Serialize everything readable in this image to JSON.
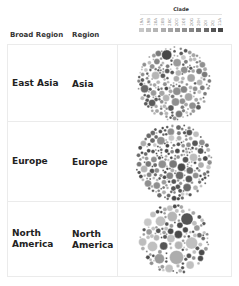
{
  "header": {
    "col_broad_region": "Broad Region",
    "col_region": "Region"
  },
  "legend": {
    "title": "Clade",
    "labels": [
      "19A",
      "19B",
      "20A",
      "20B",
      "20C",
      "20D",
      "20E",
      "20G",
      "20H",
      "20I",
      "20J",
      "21A"
    ],
    "colors": [
      "#c8c8c8",
      "#bdbdbd",
      "#b5b5b5",
      "#adadad",
      "#a5a5a5",
      "#9a9a9a",
      "#8f8f8f",
      "#858585",
      "#787878",
      "#6a6a6a",
      "#555555",
      "#484848"
    ]
  },
  "rows": [
    {
      "broad_region": "East Asia",
      "region": "Asia",
      "height": 77,
      "dominant": [
        "#7a7a7a",
        "#8f8f8f",
        "#a5a5a5",
        "#5a5a5a",
        "#b5b5b5"
      ]
    },
    {
      "broad_region": "Europe",
      "region": "Europe",
      "height": 80,
      "dominant": [
        "#4a4a4a",
        "#555555",
        "#6a6a6a",
        "#8f8f8f",
        "#adadad"
      ]
    },
    {
      "broad_region": "North America",
      "region": "North America",
      "height": 74,
      "dominant": [
        "#c0c0c0",
        "#4a4a4a",
        "#b5b5b5",
        "#555555",
        "#9a9a9a"
      ]
    }
  ],
  "chart_data": {
    "type": "packed-bubble",
    "title": "",
    "legend_title": "Clade",
    "legend_position": "top-right",
    "rows_dimension": [
      "Broad Region",
      "Region"
    ],
    "color_dimension": "Clade",
    "categories": [
      "East Asia / Asia",
      "Europe / Europe",
      "North America / North America"
    ],
    "series": [
      {
        "name": "East Asia / Asia",
        "description": "dense pack of many small-to-medium bubbles, mostly mid-gray clades"
      },
      {
        "name": "Europe / Europe",
        "description": "very dense pack of many small bubbles, predominantly dark-gray clades"
      },
      {
        "name": "North America / North America",
        "description": "pack with several large dark bubbles and many light-gray bubbles"
      }
    ]
  }
}
